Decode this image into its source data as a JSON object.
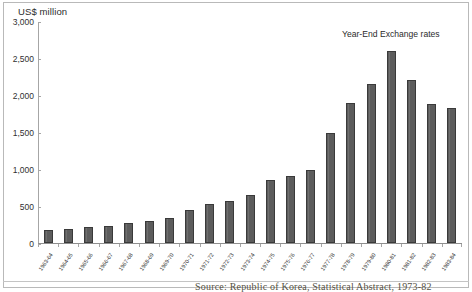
{
  "figure": {
    "y_axis_title": "US$ million",
    "annotation": "Year-End Exchange rates",
    "caption": "Source: Republic of Korea, Statistical Abstract, 1973-82",
    "bar_color": "#5c5c5c",
    "bar_border_color": "#3a3a3a",
    "frame_color": "#b9b9b9",
    "axis_color": "#a6a6a6"
  },
  "chart_data": {
    "type": "bar",
    "title": "",
    "subtitle": "",
    "xlabel": "",
    "ylabel": "US$ million",
    "ylim": [
      0,
      3000
    ],
    "ytick_values": [
      0,
      500,
      1000,
      1500,
      2000,
      2500,
      3000
    ],
    "ytick_labels": [
      "0",
      "500",
      "1,000",
      "1,500",
      "2,000",
      "2,500",
      "3,000"
    ],
    "grid": false,
    "legend": "none",
    "annotations": [
      {
        "text": "Year-End Exchange rates",
        "position": "upper-right"
      }
    ],
    "categories": [
      "1963-64",
      "1964-65",
      "1965-66",
      "1966-67",
      "1967-68",
      "1968-69",
      "1969-70",
      "1970-71",
      "1971-72",
      "1972-73",
      "1973-74",
      "1974-75",
      "1975-76",
      "1976-77",
      "1977-78",
      "1978-79",
      "1979-80",
      "1980-81",
      "1981-82",
      "1982-83",
      "1983-84"
    ],
    "values": [
      180,
      195,
      215,
      235,
      265,
      295,
      340,
      440,
      530,
      570,
      655,
      845,
      910,
      985,
      1480,
      1890,
      2150,
      2590,
      2200,
      1880,
      1820
    ]
  }
}
